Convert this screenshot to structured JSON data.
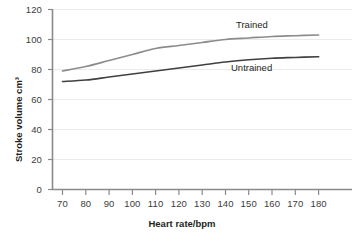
{
  "chart_data": {
    "type": "line",
    "title": "",
    "xlabel": "Heart rate/bpm",
    "ylabel": "Stroke volume cm³",
    "xlim": [
      60,
      190
    ],
    "ylim": [
      0,
      120
    ],
    "xticks": [
      70,
      80,
      90,
      100,
      110,
      120,
      130,
      140,
      150,
      160,
      170,
      180
    ],
    "yticks": [
      0,
      20,
      40,
      60,
      80,
      100,
      120
    ],
    "grid": "horizontal",
    "legend": "inline-labels",
    "series": [
      {
        "name": "Trained",
        "color": "#8c8c8c",
        "x": [
          70,
          80,
          90,
          100,
          110,
          120,
          130,
          140,
          150,
          160,
          170,
          180
        ],
        "values": [
          79,
          82,
          86,
          90,
          94,
          96,
          98,
          100,
          101,
          102,
          102.5,
          103
        ]
      },
      {
        "name": "Untrained",
        "color": "#404040",
        "x": [
          70,
          80,
          90,
          100,
          110,
          120,
          130,
          140,
          150,
          160,
          170,
          180
        ],
        "values": [
          72,
          73,
          75,
          77,
          79,
          81,
          83,
          85,
          86.5,
          87.5,
          88,
          88.5
        ]
      }
    ]
  },
  "axes": {
    "y_title": "Stroke volume cm³",
    "x_title": "Heart rate/bpm",
    "y_tick_labels": [
      "120",
      "100",
      "80",
      "60",
      "40",
      "20",
      "0"
    ],
    "x_tick_labels": [
      "70",
      "80",
      "90",
      "100",
      "110",
      "120",
      "130",
      "140",
      "150",
      "160",
      "170",
      "180"
    ]
  },
  "series_labels": {
    "trained": "Trained",
    "untrained": "Untrained"
  },
  "colors": {
    "trained_line": "#8c8c8c",
    "untrained_line": "#404040",
    "axis": "#6e6e6e",
    "grid": "#ebebeb",
    "text": "#231f20",
    "background": "#ffffff"
  }
}
